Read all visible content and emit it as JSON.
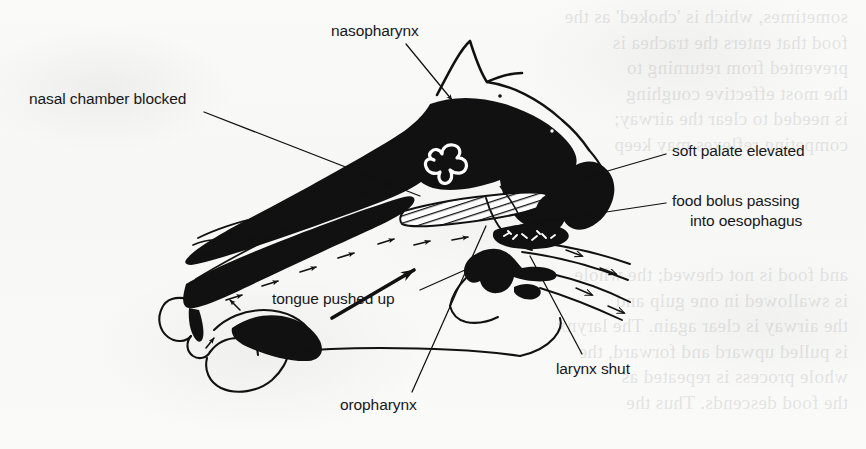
{
  "figure": {
    "type": "anatomical-line-diagram",
    "background_color": "#fbfbfa",
    "ink_color": "#111111"
  },
  "labels": [
    {
      "id": "nasopharynx",
      "text": "nasopharynx",
      "x": 331,
      "y": 22,
      "align": "left",
      "leader": {
        "from": [
          406,
          44
        ],
        "to": [
          452,
          100
        ],
        "arrowhead": true
      }
    },
    {
      "id": "nasal-chamber-blocked",
      "text": "nasal chamber blocked",
      "x": 29,
      "y": 90,
      "align": "left",
      "leader": {
        "from": [
          204,
          112
        ],
        "to": [
          420,
          196
        ],
        "arrowhead": false
      }
    },
    {
      "id": "soft-palate-elevated",
      "text": "soft palate elevated",
      "x": 672,
      "y": 142,
      "align": "left",
      "leader": {
        "from": [
          666,
          154
        ],
        "to": [
          556,
          186
        ],
        "arrowhead": false
      }
    },
    {
      "id": "food-bolus-passing",
      "text": "food bolus passing",
      "x": 672,
      "y": 192,
      "align": "left",
      "leader": {
        "from": [
          666,
          203
        ],
        "to": [
          520,
          225
        ],
        "arrowhead": false
      }
    },
    {
      "id": "into-oesophagus",
      "text": "into oesophagus",
      "x": 690,
      "y": 212,
      "align": "left",
      "leader": null
    },
    {
      "id": "tongue-pushed-up",
      "text": "tongue pushed up",
      "x": 272,
      "y": 290,
      "align": "left",
      "leader": {
        "from": [
          420,
          290
        ],
        "to": [
          474,
          266
        ],
        "arrowhead": false
      }
    },
    {
      "id": "larynx-shut",
      "text": "larynx shut",
      "x": 556,
      "y": 360,
      "align": "left",
      "leader": {
        "from": [
          582,
          354
        ],
        "to": [
          530,
          256
        ],
        "arrowhead": false
      }
    },
    {
      "id": "oropharynx",
      "text": "oropharynx",
      "x": 340,
      "y": 396,
      "align": "left",
      "leader": {
        "from": [
          412,
          392
        ],
        "to": [
          486,
          226
        ],
        "arrowhead": false
      }
    }
  ],
  "bleed_through_lines_right": [
    "sometimes, which is 'choked' as the",
    "food that enters the trachea is",
    "prevented from returning to",
    "the most effective coughing",
    "is needed to clear the airway;",
    "competing reflexes may keep"
  ],
  "bleed_through_lines_lower": [
    "and food is not chewed; the whole",
    "is swallowed in one gulp and",
    "the airway is clear again. The larynx",
    "is pulled upward and forward, the",
    "whole process is repeated as",
    "the food descends. Thus the"
  ],
  "anatomy_parts": [
    {
      "name": "nasal-chamber-filled",
      "style": "solid-black"
    },
    {
      "name": "hard-palate-hatched",
      "style": "hatched"
    },
    {
      "name": "tongue-outline",
      "style": "outline"
    },
    {
      "name": "soft-palate",
      "style": "solid-black"
    },
    {
      "name": "food-bolus",
      "style": "solid-black"
    },
    {
      "name": "larynx-epiglottis",
      "style": "solid-black"
    },
    {
      "name": "ear-pinna",
      "style": "outline"
    },
    {
      "name": "brain-cavity-squiggle",
      "style": "outline"
    },
    {
      "name": "airflow-arrows",
      "style": "arrow"
    }
  ]
}
